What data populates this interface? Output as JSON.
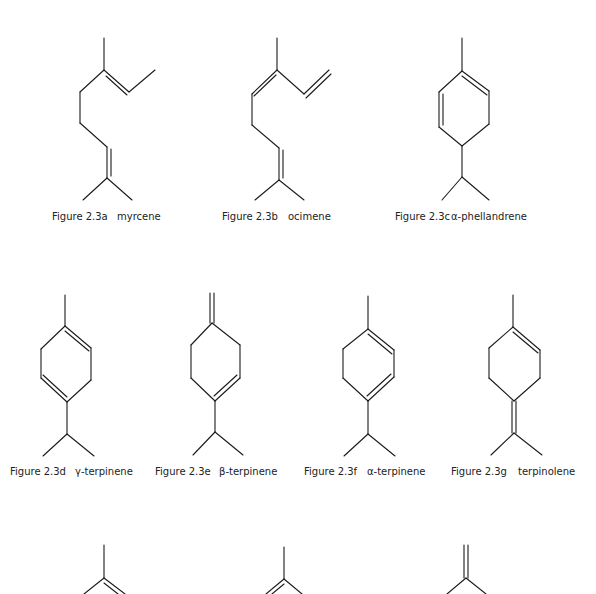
{
  "figures": [
    {
      "id": "a",
      "number": "Figure 2.3a",
      "name": "myrcene"
    },
    {
      "id": "b",
      "number": "Figure 2.3b",
      "name": "ocimene"
    },
    {
      "id": "c",
      "number": "Figure 2.3c",
      "name": "α-phellandrene"
    },
    {
      "id": "d",
      "number": "Figure 2.3d",
      "name": "γ-terpinene"
    },
    {
      "id": "e",
      "number": "Figure 2.3e",
      "name": "β-terpinene"
    },
    {
      "id": "f",
      "number": "Figure 2.3f",
      "name": "α-terpinene"
    },
    {
      "id": "g",
      "number": "Figure 2.3g",
      "name": "terpinolene"
    }
  ],
  "colors": {
    "background": "#ffffff",
    "ink": "#1a1a1a"
  }
}
